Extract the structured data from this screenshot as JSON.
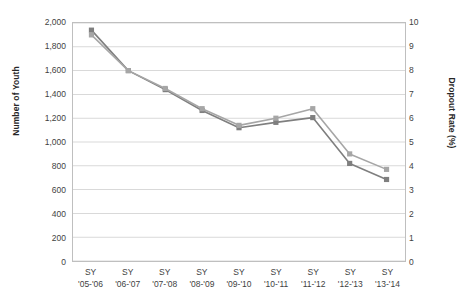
{
  "chart_data": {
    "type": "line",
    "title": "",
    "xlabel": "",
    "categories": [
      {
        "line1": "SY",
        "line2": "'05-'06"
      },
      {
        "line1": "SY",
        "line2": "'06-'07"
      },
      {
        "line1": "SY",
        "line2": "'07-'08"
      },
      {
        "line1": "SY",
        "line2": "'08-'09"
      },
      {
        "line1": "SY",
        "line2": "'09-'10"
      },
      {
        "line1": "SY",
        "line2": "'10-'11"
      },
      {
        "line1": "SY",
        "line2": "'11-'12"
      },
      {
        "line1": "SY",
        "line2": "'12-'13"
      },
      {
        "line1": "SY",
        "line2": "'13-'14"
      }
    ],
    "category_labels": [
      "SY '05-'06",
      "SY '06-'07",
      "SY '07-'08",
      "SY '08-'09",
      "SY '09-'10",
      "SY '10-'11",
      "SY '11-'12",
      "SY '12-'13",
      "SY '13-'14"
    ],
    "axes": {
      "left": {
        "label": "Number of Youth",
        "min": 0,
        "max": 2000,
        "step": 200,
        "ticks": [
          "2,000",
          "1,800",
          "1,600",
          "1,400",
          "1,200",
          "1,000",
          "800",
          "600",
          "400",
          "200",
          "0"
        ],
        "tick_values": [
          2000,
          1800,
          1600,
          1400,
          1200,
          1000,
          800,
          600,
          400,
          200,
          0
        ]
      },
      "right": {
        "label": "Dropout Rate (%)",
        "min": 0,
        "max": 10,
        "step": 1,
        "ticks": [
          "10",
          "9",
          "8",
          "7",
          "6",
          "5",
          "4",
          "3",
          "2",
          "1",
          "0"
        ],
        "tick_values": [
          10,
          9,
          8,
          7,
          6,
          5,
          4,
          3,
          2,
          1,
          0
        ]
      }
    },
    "grid": true,
    "legend": "none",
    "series": [
      {
        "name": "Number of Youth",
        "axis": "left",
        "color": "#7f7f7f",
        "marker": "square",
        "values": [
          1940,
          1600,
          1440,
          1265,
          1120,
          1165,
          1205,
          820,
          685
        ]
      },
      {
        "name": "Dropout Rate (%)",
        "axis": "right",
        "color": "#a6a6a6",
        "marker": "square",
        "values": [
          9.5,
          8.0,
          7.25,
          6.4,
          5.7,
          6.0,
          6.4,
          4.5,
          3.85
        ]
      }
    ]
  }
}
